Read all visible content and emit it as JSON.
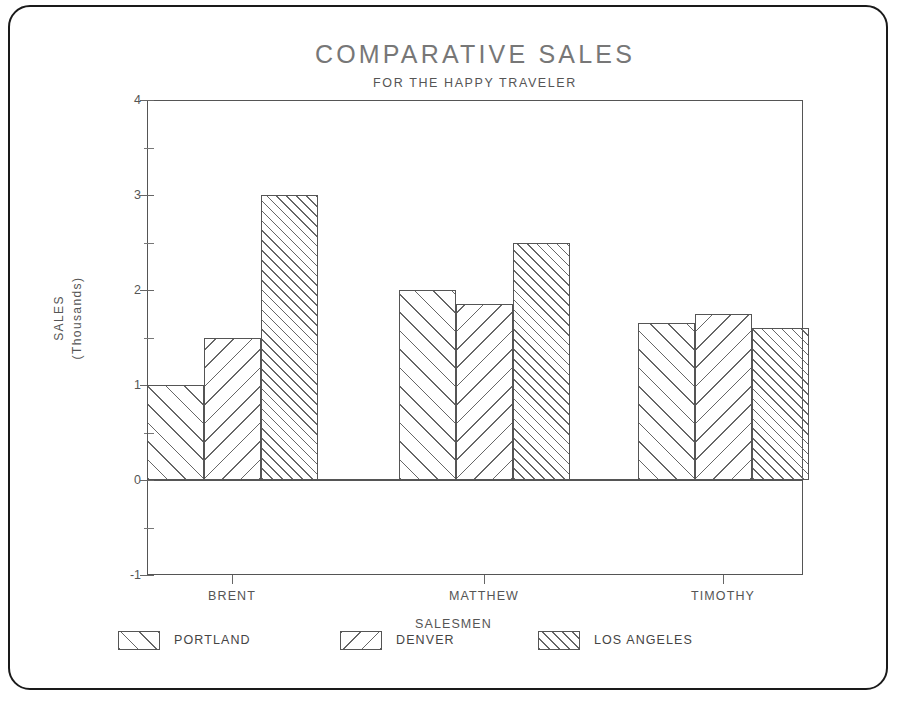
{
  "chart_data": {
    "type": "bar",
    "title": "COMPARATIVE SALES",
    "subtitle": "FOR THE HAPPY TRAVELER",
    "xlabel": "SALESMEN",
    "ylabel": "SALES\n(Thousands)",
    "ylabel_line1": "SALES",
    "ylabel_line2": "(Thousands)",
    "categories": [
      "BRENT",
      "MATTHEW",
      "TIMOTHY"
    ],
    "ylim": [
      -1,
      4
    ],
    "yticks": [
      -1,
      0,
      1,
      2,
      3,
      4
    ],
    "ytick_labels": [
      "-1",
      "0",
      "1",
      "2",
      "3",
      "4"
    ],
    "grid": false,
    "legend_position": "bottom",
    "series": [
      {
        "name": "PORTLAND",
        "hatch": "/",
        "values": [
          1.0,
          2.0,
          1.65
        ]
      },
      {
        "name": "DENVER",
        "hatch": "\\",
        "values": [
          1.5,
          1.85,
          1.75
        ]
      },
      {
        "name": "LOS ANGELES",
        "hatch": "///",
        "values": [
          3.0,
          2.5,
          1.6
        ]
      }
    ]
  },
  "legend": {
    "items": [
      {
        "label": "PORTLAND"
      },
      {
        "label": "DENVER"
      },
      {
        "label": "LOS ANGELES"
      }
    ]
  },
  "colors": {
    "frame": "#1a1a1a",
    "axis": "#555555",
    "hatch": "#666666",
    "title": "#777777",
    "text": "#444444",
    "background": "#ffffff"
  }
}
